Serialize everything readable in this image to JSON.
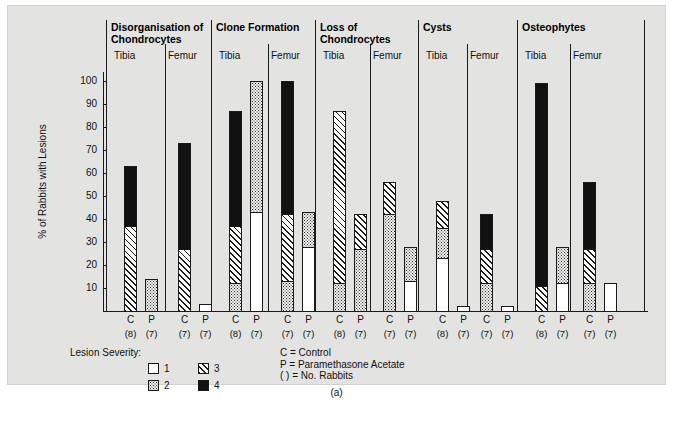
{
  "figure": {
    "panel_letter": "(a)",
    "y_axis_title": "% of Rabbits with Lesions",
    "y_ticks": [
      10,
      20,
      30,
      40,
      50,
      60,
      70,
      80,
      90,
      100
    ],
    "y_min": 0,
    "y_max": 104
  },
  "legend": {
    "title": "Lesion Severity:",
    "items": [
      {
        "key": "1",
        "pattern": "open-white"
      },
      {
        "key": "2",
        "pattern": "stipple-dots"
      },
      {
        "key": "3",
        "pattern": "diagonal-hatch"
      },
      {
        "key": "4",
        "pattern": "solid-black"
      }
    ]
  },
  "notes": [
    "C = Control",
    "P = Paramethasone Acetate",
    "( ) = No. Rabbits"
  ],
  "chart_data": {
    "type": "bar",
    "title": "",
    "subtitle": "",
    "xlabel": "",
    "ylabel": "% of Rabbits with Lesions",
    "ylim": [
      0,
      104
    ],
    "grid": false,
    "legend_position": "bottom-left",
    "stacked": true,
    "series": [
      {
        "name": "1",
        "pattern": "open-white"
      },
      {
        "name": "2",
        "pattern": "stipple-dots"
      },
      {
        "name": "3",
        "pattern": "diagonal-hatch"
      },
      {
        "name": "4",
        "pattern": "solid-black"
      }
    ],
    "groups": [
      {
        "name": "Disorganisation of\nChondrocytes",
        "subgroups": [
          {
            "name": "Tibia",
            "bars": [
              {
                "label": "C",
                "n": "(8)",
                "total": 63,
                "segments": {
                  "1": 0,
                  "2": 0,
                  "3": 37,
                  "4": 26
                }
              },
              {
                "label": "P",
                "n": "(7)",
                "total": 14,
                "segments": {
                  "1": 0,
                  "2": 14,
                  "3": 0,
                  "4": 0
                }
              }
            ]
          },
          {
            "name": "Femur",
            "bars": [
              {
                "label": "C",
                "n": "(7)",
                "total": 73,
                "segments": {
                  "1": 0,
                  "2": 0,
                  "3": 27,
                  "4": 46
                }
              },
              {
                "label": "P",
                "n": "(7)",
                "total": 3,
                "segments": {
                  "1": 3,
                  "2": 0,
                  "3": 0,
                  "4": 0
                }
              }
            ]
          }
        ]
      },
      {
        "name": "Clone Formation",
        "subgroups": [
          {
            "name": "Tibia",
            "bars": [
              {
                "label": "C",
                "n": "(8)",
                "total": 87,
                "segments": {
                  "1": 0,
                  "2": 12,
                  "3": 25,
                  "4": 50
                }
              },
              {
                "label": "P",
                "n": "(7)",
                "total": 100,
                "segments": {
                  "1": 43,
                  "2": 57,
                  "3": 0,
                  "4": 0
                }
              }
            ]
          },
          {
            "name": "Femur",
            "bars": [
              {
                "label": "C",
                "n": "(7)",
                "total": 100,
                "segments": {
                  "1": 0,
                  "2": 13,
                  "3": 29,
                  "4": 58
                }
              },
              {
                "label": "P",
                "n": "(7)",
                "total": 43,
                "segments": {
                  "1": 28,
                  "2": 15,
                  "3": 0,
                  "4": 0
                }
              }
            ]
          }
        ]
      },
      {
        "name": "Loss of\nChondrocytes",
        "subgroups": [
          {
            "name": "Tibia",
            "bars": [
              {
                "label": "C",
                "n": "(8)",
                "total": 87,
                "segments": {
                  "1": 0,
                  "2": 12,
                  "3": 75,
                  "4": 0
                }
              },
              {
                "label": "P",
                "n": "(7)",
                "total": 42,
                "segments": {
                  "1": 0,
                  "2": 27,
                  "3": 15,
                  "4": 0
                }
              }
            ]
          },
          {
            "name": "Femur",
            "bars": [
              {
                "label": "C",
                "n": "(7)",
                "total": 56,
                "segments": {
                  "1": 0,
                  "2": 42,
                  "3": 14,
                  "4": 0
                }
              },
              {
                "label": "P",
                "n": "(7)",
                "total": 28,
                "segments": {
                  "1": 13,
                  "2": 15,
                  "3": 0,
                  "4": 0
                }
              }
            ]
          }
        ]
      },
      {
        "name": "Cysts",
        "subgroups": [
          {
            "name": "Tibia",
            "bars": [
              {
                "label": "C",
                "n": "(8)",
                "total": 48,
                "segments": {
                  "1": 23,
                  "2": 13,
                  "3": 12,
                  "4": 0
                }
              },
              {
                "label": "P",
                "n": "(7)",
                "total": 2,
                "segments": {
                  "1": 2,
                  "2": 0,
                  "3": 0,
                  "4": 0
                }
              }
            ]
          },
          {
            "name": "Femur",
            "bars": [
              {
                "label": "C",
                "n": "(7)",
                "total": 42,
                "segments": {
                  "1": 0,
                  "2": 12,
                  "3": 15,
                  "4": 15
                }
              },
              {
                "label": "P",
                "n": "(7)",
                "total": 2,
                "segments": {
                  "1": 2,
                  "2": 0,
                  "3": 0,
                  "4": 0
                }
              }
            ]
          }
        ]
      },
      {
        "name": "Osteophytes",
        "subgroups": [
          {
            "name": "Tibia",
            "bars": [
              {
                "label": "C",
                "n": "(8)",
                "total": 99,
                "segments": {
                  "1": 0,
                  "2": 0,
                  "3": 11,
                  "4": 88
                }
              },
              {
                "label": "P",
                "n": "(7)",
                "total": 28,
                "segments": {
                  "1": 12,
                  "2": 16,
                  "3": 0,
                  "4": 0
                }
              }
            ]
          },
          {
            "name": "Femur",
            "bars": [
              {
                "label": "C",
                "n": "(7)",
                "total": 56,
                "segments": {
                  "1": 0,
                  "2": 12,
                  "3": 15,
                  "4": 29
                }
              },
              {
                "label": "P",
                "n": "(7)",
                "total": 12,
                "segments": {
                  "1": 12,
                  "2": 0,
                  "3": 0,
                  "4": 0
                }
              }
            ]
          }
        ]
      }
    ]
  }
}
